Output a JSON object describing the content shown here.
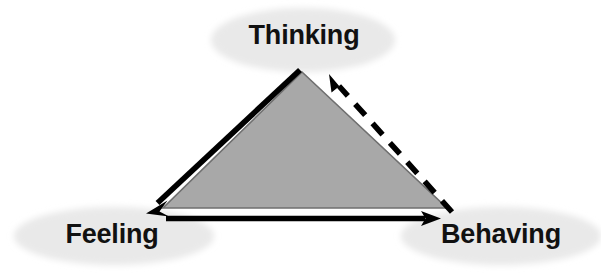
{
  "diagram": {
    "type": "cycle-diagram",
    "background_color": "#ffffff",
    "shape": {
      "name": "triangle",
      "fill_color": "#a8a8a8",
      "stroke_color": "#707070",
      "vertices": [
        {
          "label": "apex",
          "x": 302,
          "y": 72
        },
        {
          "label": "bottom-left",
          "x": 163,
          "y": 208
        },
        {
          "label": "bottom-right",
          "x": 447,
          "y": 208
        }
      ]
    },
    "ellipse_color": "#e9e9e9",
    "arrow_color": "#000000",
    "nodes": [
      {
        "id": "thinking",
        "label": "Thinking",
        "cx": 303,
        "cy": 40,
        "rx": 92,
        "ry": 32
      },
      {
        "id": "feeling",
        "label": "Feeling",
        "cx": 114,
        "cy": 236,
        "rx": 100,
        "ry": 29
      },
      {
        "id": "behaving",
        "label": "Behaving",
        "cx": 501,
        "cy": 236,
        "rx": 100,
        "ry": 29
      }
    ],
    "arrows": [
      {
        "id": "thinking-to-feeling",
        "from": "thinking",
        "to": "feeling",
        "style": "solid",
        "direction": "down-left"
      },
      {
        "id": "feeling-to-behaving",
        "from": "feeling",
        "to": "behaving",
        "style": "solid",
        "direction": "right"
      },
      {
        "id": "behaving-to-thinking",
        "from": "behaving",
        "to": "thinking",
        "style": "dashed",
        "direction": "up-left"
      }
    ]
  }
}
